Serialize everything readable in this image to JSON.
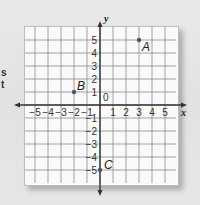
{
  "background_fragments": [
    "s",
    "t"
  ],
  "chart_data": {
    "type": "scatter",
    "title": "",
    "xlabel": "x",
    "ylabel": "y",
    "xlim": [
      -6,
      6
    ],
    "ylim": [
      -6,
      6
    ],
    "grid": true,
    "origin_label": "0",
    "x_ticks": [
      -5,
      -4,
      -3,
      -2,
      -1,
      1,
      2,
      3,
      4,
      5
    ],
    "y_ticks": [
      5,
      4,
      3,
      2,
      1,
      -1,
      -2,
      -3,
      -4,
      -5
    ],
    "points": [
      {
        "label": "A",
        "x": 3,
        "y": 5
      },
      {
        "label": "B",
        "x": -2,
        "y": 1
      },
      {
        "label": "C",
        "x": 0,
        "y": -5
      }
    ]
  },
  "colors": {
    "grid_line": "#8a8a8a",
    "axis": "#333333",
    "point": "#555555",
    "panel": "#fafafa",
    "page": "#e4e4e4"
  }
}
